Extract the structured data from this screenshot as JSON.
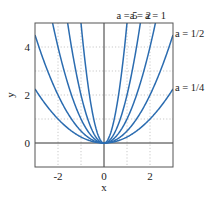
{
  "chart_data": {
    "type": "line",
    "title": "",
    "xlabel": "x",
    "ylabel": "y",
    "xlim": [
      -3,
      3
    ],
    "ylim": [
      -1,
      5
    ],
    "xticks": [
      -2,
      0,
      2
    ],
    "xtick_labels": [
      "-2",
      "0",
      "2"
    ],
    "yticks": [
      0,
      2,
      4
    ],
    "ytick_labels": [
      "0",
      "2",
      "4"
    ],
    "grid": true,
    "grid_x": [
      -2,
      -1,
      1,
      2
    ],
    "grid_y": [
      1,
      2,
      3,
      4
    ],
    "function": "y = a x^2",
    "series": [
      {
        "name": "a = 5",
        "a": 5
      },
      {
        "name": "a = 2",
        "a": 2
      },
      {
        "name": "a = 1",
        "a": 1
      },
      {
        "name": "a = 1/2",
        "a": 0.5
      },
      {
        "name": "a = 1/4",
        "a": 0.25
      }
    ],
    "legend": "inline-labels at curve ends (top and right)",
    "line_color": "#2b6cb0"
  }
}
